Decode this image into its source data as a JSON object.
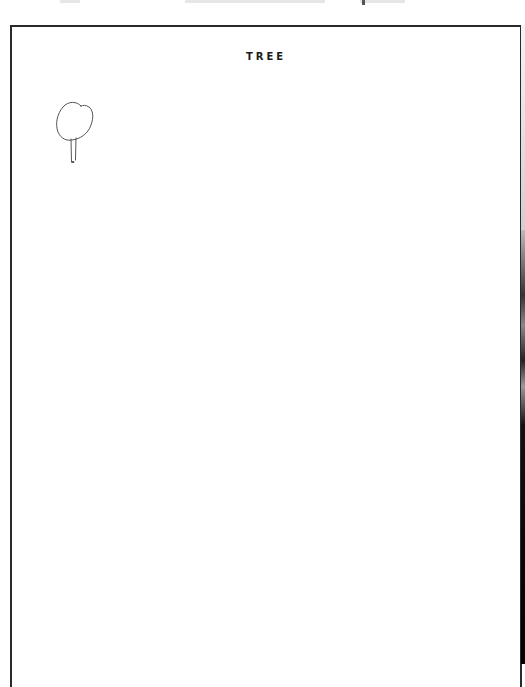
{
  "document": {
    "title": "TREE",
    "drawing": {
      "subject": "tree-sketch",
      "description": "Small hand-drawn tree: rounded crown on a thin two-line trunk, upper-left of the page"
    }
  },
  "colors": {
    "border": "#2a2a2a",
    "ink": "#1a1a1a",
    "pencil": "#555555",
    "paper": "#ffffff"
  }
}
